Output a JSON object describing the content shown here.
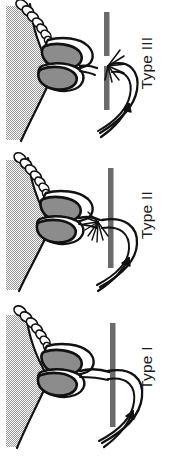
{
  "figure": {
    "orientation": "rotated-90",
    "background_color": "#ffffff",
    "panel_count": 3
  },
  "palette": {
    "outline": "#111111",
    "organ_fill": "#8c8c8c",
    "tissue_fill": "#d9d9d9",
    "bar_fill": "#6b6b6b",
    "white": "#ffffff",
    "label_color": "#1a1a1a"
  },
  "panels": [
    {
      "id": "panel-3",
      "label": "Type III",
      "order": 1,
      "duct_junction": "interrupted",
      "bar_state": "broken",
      "spray_lines": 7,
      "arrow_count": 1,
      "lobes": 2,
      "bead_count": 7
    },
    {
      "id": "panel-2",
      "label": "Type II",
      "order": 2,
      "duct_junction": "fanned",
      "bar_state": "continuous",
      "spray_lines": 9,
      "arrow_count": 1,
      "lobes": 2,
      "bead_count": 7
    },
    {
      "id": "panel-1",
      "label": "Type I",
      "order": 3,
      "duct_junction": "direct",
      "bar_state": "continuous",
      "spray_lines": 0,
      "arrow_count": 1,
      "lobes": 2,
      "bead_count": 7
    }
  ]
}
